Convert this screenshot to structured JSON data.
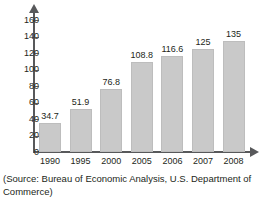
{
  "chart_data": {
    "type": "bar",
    "title": "",
    "xlabel": "",
    "ylabel": "",
    "categories": [
      "1990",
      "1995",
      "2000",
      "2005",
      "2006",
      "2007",
      "2008"
    ],
    "values": [
      34.7,
      51.9,
      76.8,
      108.8,
      116.6,
      125,
      135
    ],
    "value_labels": [
      "34.7",
      "51.9",
      "76.8",
      "108.8",
      "116.6",
      "125",
      "135"
    ],
    "ylim": [
      0,
      170
    ],
    "yticks": [
      0,
      20,
      40,
      60,
      80,
      100,
      120,
      140,
      160
    ],
    "ytick_labels": [
      "0",
      "20",
      "40",
      "60",
      "80",
      "100",
      "120",
      "140",
      "160"
    ],
    "grid": false,
    "legend": "none",
    "bar_color": "#c9c9c9",
    "axis_color": "#58595b",
    "text_color": "#231f20"
  },
  "caption": {
    "text": "(Source: Bureau of Economic Analysis, U.S. Department of Commerce)"
  }
}
